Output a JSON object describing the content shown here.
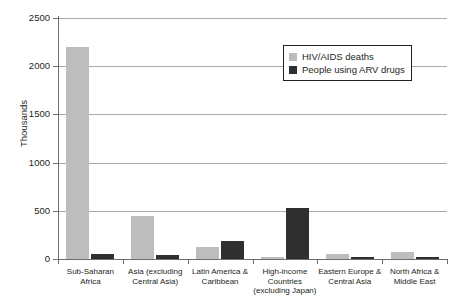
{
  "chart_data": {
    "type": "bar",
    "title": "",
    "xlabel": "",
    "ylabel": "Thousands",
    "ylim": [
      0,
      2500
    ],
    "yticks": [
      0,
      500,
      1000,
      1500,
      2000,
      2500
    ],
    "ytick_labels": [
      "0",
      "500",
      "1000",
      "1500",
      "2000",
      "2500"
    ],
    "grid": true,
    "legend_position": "upper-right",
    "categories": [
      "Sub-Saharan Africa",
      "Asia (excluding Central Asia)",
      "Latin America & Caribbean",
      "High-income Countries (excluding Japan)",
      "Eastern Europe & Central Asia",
      "North Africa & Middle East"
    ],
    "category_lines": [
      [
        "Sub-Saharan",
        "Africa"
      ],
      [
        "Asia (excluding",
        "Central Asia)"
      ],
      [
        "Latin America &",
        "Caribbean"
      ],
      [
        "High-income",
        "Countries",
        "(excluding Japan)"
      ],
      [
        "Eastern Europe &",
        "Central Asia"
      ],
      [
        "North Africa &",
        "Middle East"
      ]
    ],
    "series": [
      {
        "name": "HIV/AIDS deaths",
        "color": "#bdbdbd",
        "values": [
          2200,
          450,
          120,
          25,
          50,
          75
        ]
      },
      {
        "name": "People using ARV drugs",
        "color": "#2f2f2f",
        "values": [
          50,
          45,
          190,
          530,
          15,
          10
        ]
      }
    ]
  },
  "legend": {
    "items": [
      {
        "label": "HIV/AIDS deaths",
        "color": "#bdbdbd"
      },
      {
        "label": "People using ARV drugs",
        "color": "#2f2f2f"
      }
    ]
  }
}
